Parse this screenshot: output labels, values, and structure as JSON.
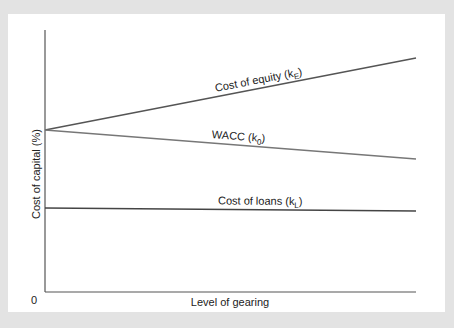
{
  "chart_data": {
    "type": "line",
    "title": "",
    "xlabel": "Level of gearing",
    "ylabel": "Cost of capital (%)",
    "origin_label": "0",
    "xlim": [
      0,
      1
    ],
    "ylim": [
      0,
      100
    ],
    "grid": false,
    "legend": "none (inline line labels)",
    "series": [
      {
        "name": "Cost of equity",
        "label": "Cost of equity (k",
        "subscript": "E",
        "label_suffix": ")",
        "x": [
          0,
          1
        ],
        "values": [
          61.8,
          89.3
        ],
        "color": "#555555"
      },
      {
        "name": "WACC",
        "label": "WACC (k",
        "subscript": "0",
        "label_suffix": ")",
        "x": [
          0,
          1
        ],
        "values": [
          61.8,
          50.8
        ],
        "color": "#777777"
      },
      {
        "name": "Cost of loans",
        "label": "Cost of loans (k",
        "subscript": "L",
        "label_suffix": ")",
        "x": [
          0,
          1
        ],
        "values": [
          32.1,
          30.9
        ],
        "color": "#444444"
      }
    ]
  }
}
